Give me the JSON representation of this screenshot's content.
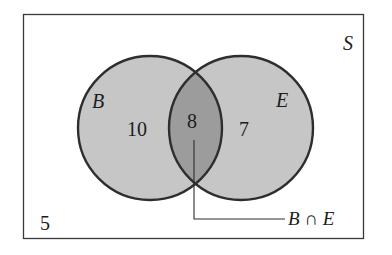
{
  "diagram": {
    "type": "venn",
    "universe_label": "S",
    "sets": [
      {
        "id": "B",
        "label": "B",
        "only_count": "10"
      },
      {
        "id": "E",
        "label": "E",
        "only_count": "7"
      }
    ],
    "intersection": {
      "count": "8",
      "label": "B ∩ E"
    },
    "outside_count": "5",
    "colors": {
      "frame": "#3a3a3a",
      "circle_stroke": "#2e2e2e",
      "circle_fill": "#c6c6c6",
      "intersection_fill": "#9c9c9c",
      "text": "#1c1c1c"
    }
  }
}
